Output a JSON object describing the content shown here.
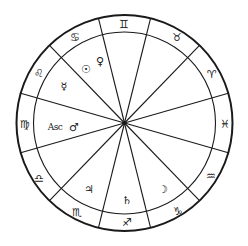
{
  "chart": {
    "center": [
      124.5,
      123
    ],
    "outer_radius": 108,
    "inner_radius": 91,
    "line_color": "#1a1a1a",
    "background": "#ffffff",
    "spokes_deg": [
      -76,
      -46,
      -16,
      16,
      46,
      76,
      104,
      134,
      164,
      196,
      226,
      256
    ]
  },
  "signs": [
    {
      "name": "Gemini",
      "glyph": "♊",
      "x": 124,
      "y": 24
    },
    {
      "name": "Taurus",
      "glyph": "♉",
      "x": 177,
      "y": 37
    },
    {
      "name": "Aries",
      "glyph": "♈",
      "x": 212,
      "y": 74
    },
    {
      "name": "Pisces",
      "glyph": "♓",
      "x": 225,
      "y": 124
    },
    {
      "name": "Aquarius",
      "glyph": "♒",
      "x": 211,
      "y": 176
    },
    {
      "name": "Capricorn",
      "glyph": "♑",
      "x": 178,
      "y": 211
    },
    {
      "name": "Sagittarius",
      "glyph": "♐",
      "x": 127,
      "y": 222
    },
    {
      "name": "Scorpio",
      "glyph": "♏",
      "x": 77,
      "y": 212
    },
    {
      "name": "Libra",
      "glyph": "♎",
      "x": 39,
      "y": 178
    },
    {
      "name": "Virgo",
      "glyph": "♍",
      "x": 25,
      "y": 124
    },
    {
      "name": "Leo",
      "glyph": "♌",
      "x": 39,
      "y": 73
    },
    {
      "name": "Cancer",
      "glyph": "♋",
      "x": 75,
      "y": 37
    }
  ],
  "planets": [
    {
      "name": "Sun",
      "glyph": "☉",
      "x": 86,
      "y": 69
    },
    {
      "name": "Venus",
      "glyph": "♀",
      "x": 100,
      "y": 61
    },
    {
      "name": "Mercury",
      "glyph": "☿",
      "x": 64,
      "y": 86
    },
    {
      "name": "Mars",
      "glyph": "♂",
      "x": 74,
      "y": 127
    },
    {
      "name": "Jupiter",
      "glyph": "♃",
      "x": 89,
      "y": 189
    },
    {
      "name": "Saturn",
      "glyph": "♄",
      "x": 127,
      "y": 200
    },
    {
      "name": "Moon",
      "glyph": "☽",
      "x": 163,
      "y": 189
    }
  ],
  "ascendant": {
    "label": "Asc",
    "x": 55,
    "y": 127
  }
}
